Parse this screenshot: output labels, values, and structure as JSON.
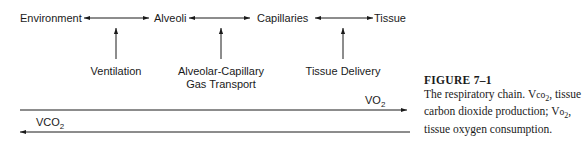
{
  "figure": {
    "nodes": [
      {
        "id": "environment",
        "label": "Environment"
      },
      {
        "id": "alveoli",
        "label": "Alveoli"
      },
      {
        "id": "capillaries",
        "label": "Capillaries"
      },
      {
        "id": "tissue",
        "label": "Tissue"
      }
    ],
    "processes": [
      {
        "id": "ventilation",
        "lines": [
          "Ventilation"
        ]
      },
      {
        "id": "alveolar-capillary",
        "lines": [
          "Alveolar-Capillary",
          "Gas Transport"
        ]
      },
      {
        "id": "tissue-delivery",
        "lines": [
          "Tissue Delivery"
        ]
      }
    ],
    "flows": {
      "vo2": {
        "base": "VO",
        "sub": "2",
        "direction": "right"
      },
      "vco2": {
        "base": "VCO",
        "sub": "2",
        "direction": "left"
      }
    },
    "caption": {
      "title": "FIGURE 7–1",
      "text_1": "The respiratory chain. V",
      "text_2": "co",
      "text_3": "2",
      "text_4": ", tissue carbon dioxide production; V",
      "text_5": "o",
      "text_6": "2",
      "text_7": ", tissue oxygen consumption."
    }
  }
}
